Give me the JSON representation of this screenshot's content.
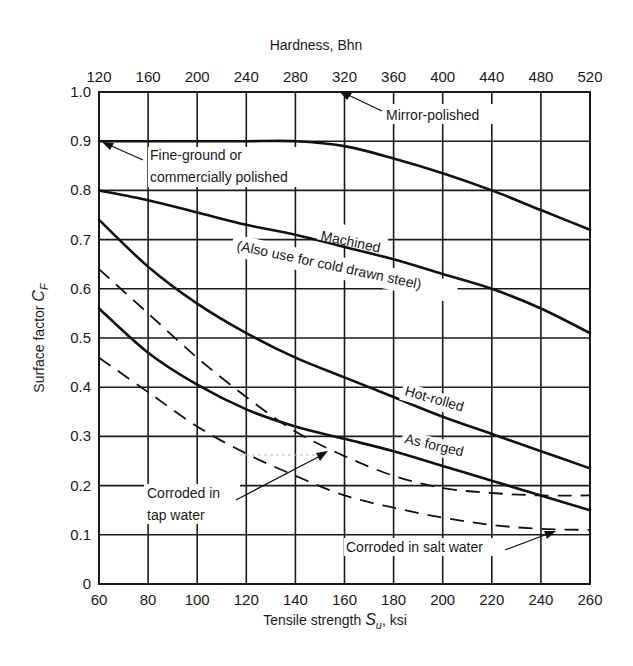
{
  "chart_data": {
    "type": "line",
    "title": "",
    "xlabel": "Tensile strength S_u, ksi",
    "xlabel_main": "Tensile strength ",
    "xlabel_symbol": "S",
    "xlabel_sub": "u",
    "xlabel_unit": ", ksi",
    "ylabel": "Surface factor C_F",
    "ylabel_main": "Surface factor ",
    "ylabel_symbol": "C",
    "ylabel_sub": "F",
    "secondary_xlabel": "Hardness, Bhn",
    "xlim": [
      60,
      260
    ],
    "ylim": [
      0,
      1.0
    ],
    "grid": true,
    "x_ticks": [
      "60",
      "80",
      "100",
      "120",
      "140",
      "160",
      "180",
      "200",
      "220",
      "240",
      "260"
    ],
    "x_tick_values": [
      60,
      80,
      100,
      120,
      140,
      160,
      180,
      200,
      220,
      240,
      260
    ],
    "y_ticks": [
      "0",
      "0.1",
      "0.2",
      "0.3",
      "0.4",
      "0.5",
      "0.6",
      "0.7",
      "0.8",
      "0.9",
      "1.0"
    ],
    "y_tick_values": [
      0,
      0.1,
      0.2,
      0.3,
      0.4,
      0.5,
      0.6,
      0.7,
      0.8,
      0.9,
      1.0
    ],
    "secondary_x_ticks": [
      "120",
      "160",
      "200",
      "240",
      "280",
      "320",
      "360",
      "400",
      "440",
      "480",
      "520"
    ],
    "secondary_x_tick_positions_ksi": [
      60,
      80,
      100,
      120,
      140,
      160,
      180,
      200,
      220,
      240,
      260
    ],
    "x": [
      60,
      80,
      100,
      120,
      140,
      160,
      180,
      200,
      220,
      240,
      260
    ],
    "series": [
      {
        "name": "Mirror-polished",
        "style": "solid",
        "values": [
          1.0,
          1.0,
          1.0,
          1.0,
          1.0,
          1.0,
          1.0,
          1.0,
          1.0,
          1.0,
          1.0
        ]
      },
      {
        "name": "Fine-ground or commercially polished",
        "style": "solid",
        "values": [
          0.9,
          0.9,
          0.9,
          0.9,
          0.9,
          0.89,
          0.865,
          0.835,
          0.8,
          0.76,
          0.72
        ]
      },
      {
        "name": "Machined (Also use for cold drawn steel)",
        "style": "solid",
        "values": [
          0.8,
          0.78,
          0.755,
          0.73,
          0.71,
          0.685,
          0.66,
          0.63,
          0.6,
          0.56,
          0.51
        ]
      },
      {
        "name": "Hot-rolled",
        "style": "solid",
        "values": [
          0.74,
          0.645,
          0.57,
          0.51,
          0.46,
          0.42,
          0.38,
          0.34,
          0.305,
          0.27,
          0.235
        ]
      },
      {
        "name": "As forged",
        "style": "solid",
        "values": [
          0.56,
          0.47,
          0.405,
          0.355,
          0.32,
          0.295,
          0.27,
          0.24,
          0.21,
          0.18,
          0.15
        ]
      },
      {
        "name": "Corroded in tap water",
        "style": "dashed",
        "values": [
          0.64,
          0.55,
          0.46,
          0.38,
          0.31,
          0.26,
          0.22,
          0.195,
          0.185,
          0.18,
          0.18
        ]
      },
      {
        "name": "Corroded in salt water",
        "style": "dashed",
        "values": [
          0.46,
          0.39,
          0.32,
          0.265,
          0.22,
          0.18,
          0.155,
          0.135,
          0.12,
          0.112,
          0.11
        ]
      }
    ],
    "annotations": [
      {
        "text": "Mirror-polished",
        "arrow_to": [
          165,
          1.0
        ]
      },
      {
        "text": "Fine-ground or",
        "line2": "commercially polished",
        "arrow_to": [
          60,
          0.9
        ]
      },
      {
        "text": "Machined",
        "line2": "(Also use for cold drawn steel)",
        "rotated": true
      },
      {
        "text": "Hot-rolled",
        "rotated": true
      },
      {
        "text": "As forged",
        "rotated": true
      },
      {
        "text": "Corroded in",
        "line2": "tap water",
        "arrow_to": [
          160,
          0.27
        ]
      },
      {
        "text": "Corroded in salt water",
        "arrow_to": [
          248,
          0.11
        ]
      }
    ],
    "legend_position": "none (inline labels)"
  },
  "labels": {
    "mirror": "Mirror-polished",
    "fine1": "Fine-ground or",
    "fine2": "commercially polished",
    "mach1": "Machined",
    "mach2": "(Also use for cold drawn steel)",
    "hot": "Hot-rolled",
    "forged": "As forged",
    "tap1": "Corroded in",
    "tap2": "tap water",
    "salt": "Corroded in salt water"
  },
  "colors": {
    "ink": "#111111",
    "background": "#ffffff"
  }
}
